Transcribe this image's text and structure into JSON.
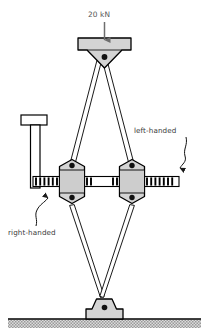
{
  "diagram": {
    "background_color": "#ffffff",
    "line_color": "#000000",
    "metal_fill": "#d4d4d4",
    "metal_fill_light": "#e2e2e2",
    "ground_fill": "#cfcfcf",
    "arrow_color": "#6e6e6e",
    "text_color": "#3a3a3a"
  },
  "annotations": {
    "load": {
      "label": "20 kN",
      "icon": "down-arrow-icon",
      "arrow_direction": "down"
    },
    "left_thread": {
      "label": "left-handed",
      "leader": "wavy-leader-icon",
      "points_to": "right-end-threaded-rod"
    },
    "right_thread": {
      "label": "right-handed",
      "leader": "wavy-leader-icon",
      "points_to": "left-end-threaded-rod"
    }
  },
  "components": {
    "top_block": "top-load-block",
    "bottom_block": "base-support-block",
    "left_nut": "left-nut-block",
    "right_nut": "right-nut-block",
    "crank_handle": "crank-handle",
    "turnbuckle_rod": "turnbuckle-threaded-rod",
    "links": [
      "link-top-left",
      "link-top-right",
      "link-bottom-left",
      "link-bottom-right"
    ],
    "pins": [
      "pin-top",
      "pin-left-upper",
      "pin-left-lower",
      "pin-right-upper",
      "pin-right-lower",
      "pin-bottom"
    ],
    "ground": "ground-hatching"
  }
}
